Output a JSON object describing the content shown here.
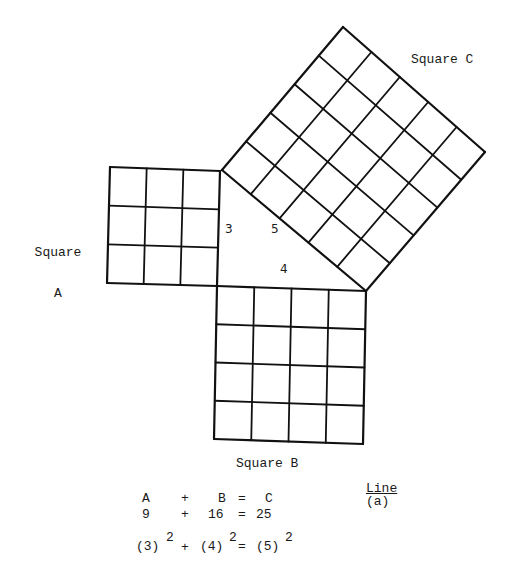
{
  "diagram": {
    "stroke_color": "#111111",
    "background": "#ffffff",
    "squares": [
      {
        "id": "A",
        "label_line1": "Square",
        "label_line2": "A",
        "grid": 3,
        "corners": {
          "tl": [
            110,
            167
          ],
          "tr": [
            220,
            171
          ],
          "br": [
            217,
            286
          ],
          "bl": [
            107,
            283
          ]
        }
      },
      {
        "id": "B",
        "label": "Square B",
        "grid": 4,
        "corners": {
          "tl": [
            217,
            286
          ],
          "tr": [
            366,
            291
          ],
          "br": [
            363,
            444
          ],
          "bl": [
            214,
            439
          ]
        }
      },
      {
        "id": "C",
        "label": "Square C",
        "grid": 5,
        "corners": {
          "tl": [
            343,
            27
          ],
          "tr": [
            485,
            152
          ],
          "br": [
            366,
            291
          ],
          "bl": [
            222,
            170
          ]
        }
      }
    ],
    "triangle_sides": {
      "side_a": "3",
      "side_b": "4",
      "side_c": "5"
    }
  },
  "equations": {
    "row1": {
      "a": "A",
      "plus": "+",
      "b": "B",
      "eq": "=",
      "c": "C"
    },
    "row2": {
      "a": "9",
      "plus": "+",
      "b": "16",
      "eq": "=",
      "c": "25"
    },
    "row3": {
      "a_base": "(3)",
      "a_exp": "2",
      "plus": "+",
      "b_base": "(4)",
      "b_exp": "2",
      "eq": "=",
      "c_base": "(5)",
      "c_exp": "2"
    }
  },
  "line_note": {
    "title": "Line",
    "sub": "(a)"
  }
}
